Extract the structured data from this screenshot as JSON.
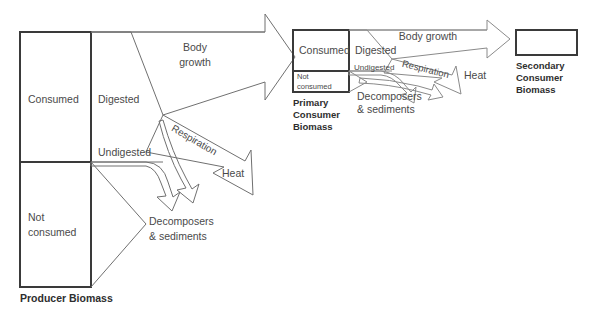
{
  "diagram": {
    "background_color": "#ffffff",
    "stroke_color": "#3a3a3a",
    "thin_stroke_color": "#707070",
    "text_color": "#4a4a4a"
  },
  "producer": {
    "caption": "Producer Biomass",
    "segments": [
      {
        "label": "Consumed"
      },
      {
        "label": "Not\nconsumed",
        "line1": "Not",
        "line2": "consumed"
      }
    ]
  },
  "primary_consumer": {
    "caption_line1": "Primary",
    "caption_line2": "Consumer",
    "caption_line3": "Biomass",
    "segments": [
      {
        "label": "Consumed"
      },
      {
        "line1": "Not",
        "line2": "consumed"
      }
    ]
  },
  "secondary_consumer": {
    "caption_line1": "Secondary",
    "caption_line2": "Consumer",
    "caption_line3": "Biomass"
  },
  "level1_flows": {
    "digested": "Digested",
    "undigested": "Undigested",
    "body_growth_line1": "Body",
    "body_growth_line2": "growth",
    "respiration": "Respiration",
    "heat": "Heat",
    "decomposers_line1": "Decomposers",
    "decomposers_line2": "& sediments"
  },
  "level2_flows": {
    "digested": "Digested",
    "undigested": "Undigested",
    "body_growth": "Body growth",
    "respiration": "Respiration",
    "heat": "Heat",
    "decomposers_line1": "Decomposers",
    "decomposers_line2": "& sediments"
  }
}
